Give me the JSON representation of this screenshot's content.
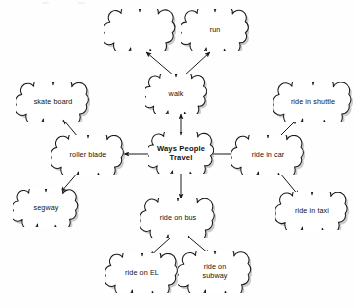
{
  "diagram": {
    "type": "concept-map",
    "background_color": "#fefefe",
    "stroke_color": "#1a1a1a",
    "shadow_color": "#9a9a9a",
    "text_color": "#111111",
    "nodes": [
      {
        "id": "blank",
        "label": "",
        "x": 140,
        "y": 30,
        "w": 72,
        "h": 42,
        "central": false
      },
      {
        "id": "run",
        "label": "run",
        "x": 215,
        "y": 30,
        "w": 68,
        "h": 42,
        "central": false
      },
      {
        "id": "walk",
        "label": "walk",
        "x": 176,
        "y": 94,
        "w": 62,
        "h": 40,
        "central": false
      },
      {
        "id": "skate_board",
        "label": "skate board",
        "x": 53,
        "y": 102,
        "w": 74,
        "h": 40,
        "central": false
      },
      {
        "id": "roller_blade",
        "label": "roller blade",
        "x": 88,
        "y": 155,
        "w": 74,
        "h": 40,
        "central": false
      },
      {
        "id": "segway",
        "label": "segway",
        "x": 46,
        "y": 208,
        "w": 66,
        "h": 38,
        "central": false
      },
      {
        "id": "center",
        "label": "Ways People\nTravel",
        "x": 181,
        "y": 153,
        "w": 66,
        "h": 42,
        "central": true
      },
      {
        "id": "ride_in_car",
        "label": "ride in car",
        "x": 268,
        "y": 155,
        "w": 74,
        "h": 40,
        "central": false
      },
      {
        "id": "ride_in_shuttle",
        "label": "ride in shuttle",
        "x": 313,
        "y": 102,
        "w": 80,
        "h": 40,
        "central": false
      },
      {
        "id": "ride_in_taxi",
        "label": "ride in taxi",
        "x": 312,
        "y": 211,
        "w": 74,
        "h": 38,
        "central": false
      },
      {
        "id": "ride_on_bus",
        "label": "ride on bus",
        "x": 178,
        "y": 218,
        "w": 76,
        "h": 40,
        "central": false
      },
      {
        "id": "ride_on_el",
        "label": "ride on EL",
        "x": 142,
        "y": 273,
        "w": 74,
        "h": 40,
        "central": false
      },
      {
        "id": "ride_on_subway",
        "label": "ride on\nsubway",
        "x": 215,
        "y": 272,
        "w": 74,
        "h": 42,
        "central": false
      }
    ],
    "edges": [
      {
        "id": "center-walk",
        "from": "center",
        "to": "walk",
        "x1": 181,
        "y1": 133,
        "x2": 181,
        "y2": 114
      },
      {
        "id": "center-roller-blade",
        "from": "center",
        "to": "roller_blade",
        "x1": 150,
        "y1": 154,
        "x2": 124,
        "y2": 154
      },
      {
        "id": "center-ride-in-car",
        "from": "center",
        "to": "ride_in_car",
        "x1": 213,
        "y1": 154,
        "x2": 237,
        "y2": 154
      },
      {
        "id": "center-ride-on-bus",
        "from": "center",
        "to": "ride_on_bus",
        "x1": 181,
        "y1": 174,
        "x2": 181,
        "y2": 199
      },
      {
        "id": "walk-blank",
        "from": "walk",
        "to": "blank",
        "x1": 174,
        "y1": 76,
        "x2": 146,
        "y2": 52
      },
      {
        "id": "walk-run",
        "from": "walk",
        "to": "run",
        "x1": 184,
        "y1": 76,
        "x2": 210,
        "y2": 52
      },
      {
        "id": "roller-blade-skate",
        "from": "roller_blade",
        "to": "skate_board",
        "x1": 78,
        "y1": 137,
        "x2": 63,
        "y2": 119
      },
      {
        "id": "roller-blade-segway",
        "from": "roller_blade",
        "to": "segway",
        "x1": 78,
        "y1": 172,
        "x2": 61,
        "y2": 192
      },
      {
        "id": "car-shuttle",
        "from": "ride_in_car",
        "to": "ride_in_shuttle",
        "x1": 279,
        "y1": 137,
        "x2": 297,
        "y2": 119
      },
      {
        "id": "car-taxi",
        "from": "ride_in_car",
        "to": "ride_in_taxi",
        "x1": 280,
        "y1": 173,
        "x2": 299,
        "y2": 196
      },
      {
        "id": "bus-el",
        "from": "ride_on_bus",
        "to": "ride_on_el",
        "x1": 170,
        "y1": 238,
        "x2": 150,
        "y2": 256
      },
      {
        "id": "bus-subway",
        "from": "ride_on_bus",
        "to": "ride_on_subway",
        "x1": 190,
        "y1": 238,
        "x2": 210,
        "y2": 255
      }
    ]
  }
}
